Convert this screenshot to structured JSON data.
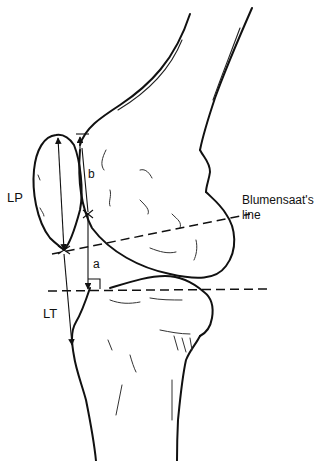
{
  "figure": {
    "labels": {
      "patella_length": "LP",
      "tendon_length": "LT",
      "dist_a": "a",
      "dist_b": "b",
      "blumensaat_line_1": "Blumensaat's",
      "blumensaat_line_2": "line"
    },
    "colors": {
      "ink": "#111111",
      "background": "#ffffff"
    }
  }
}
